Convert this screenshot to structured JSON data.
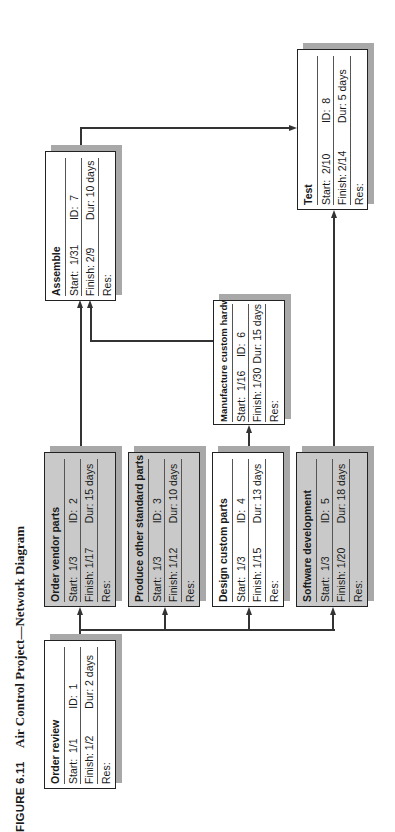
{
  "figure": {
    "label": "FIGURE 6.11",
    "title": "Air Control Project—Network Diagram"
  },
  "labels": {
    "start": "Start:",
    "id": "ID:",
    "finish": "Finish:",
    "dur": "Dur:",
    "res": "Res:"
  },
  "nodes": [
    {
      "id": "1",
      "name": "Order review",
      "start": "1/1",
      "finish": "1/2",
      "dur": "2 days",
      "res": "",
      "critical": false
    },
    {
      "id": "2",
      "name": "Order vendor parts",
      "start": "1/3",
      "finish": "1/17",
      "dur": "15 days",
      "res": "",
      "critical": true
    },
    {
      "id": "3",
      "name": "Produce other standard parts",
      "start": "1/3",
      "finish": "1/12",
      "dur": "10 days",
      "res": "",
      "critical": true
    },
    {
      "id": "4",
      "name": "Design custom parts",
      "start": "1/3",
      "finish": "1/15",
      "dur": "13 days",
      "res": "",
      "critical": false
    },
    {
      "id": "5",
      "name": "Software development",
      "start": "1/3",
      "finish": "1/20",
      "dur": "18 days",
      "res": "",
      "critical": true
    },
    {
      "id": "6",
      "name": "Manufacture custom hardware",
      "start": "1/16",
      "finish": "1/30",
      "dur": "15 days",
      "res": "",
      "critical": false
    },
    {
      "id": "7",
      "name": "Assemble",
      "start": "1/31",
      "finish": "2/9",
      "dur": "10 days",
      "res": "",
      "critical": false
    },
    {
      "id": "8",
      "name": "Test",
      "start": "2/10",
      "finish": "2/14",
      "dur": "5 days",
      "res": "",
      "critical": false
    }
  ],
  "edges": [
    {
      "from": "1",
      "to": "2"
    },
    {
      "from": "1",
      "to": "3"
    },
    {
      "from": "1",
      "to": "4"
    },
    {
      "from": "1",
      "to": "5"
    },
    {
      "from": "2",
      "to": "7"
    },
    {
      "from": "4",
      "to": "6"
    },
    {
      "from": "6",
      "to": "7"
    },
    {
      "from": "7",
      "to": "8"
    },
    {
      "from": "5",
      "to": "8"
    }
  ],
  "colors": {
    "critical_fill": "#c9c9c9",
    "normal_fill": "#ffffff",
    "shadow": "#a8a8a8",
    "line": "#333333"
  }
}
